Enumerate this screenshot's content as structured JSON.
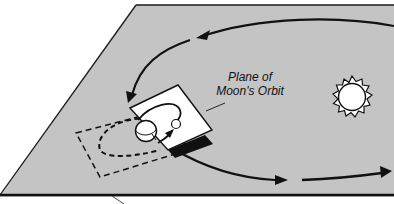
{
  "diagram": {
    "labels": {
      "plane_label_line1": "Plane of",
      "plane_label_line2": "Moon's Orbit"
    },
    "elements": {
      "ecliptic_plane": "gray parallelogram representing Earth's orbital plane",
      "sun": "sun-icon",
      "earth": "earth-icon",
      "moon": "moon-icon",
      "moon_orbit_plane": "tilted white plane",
      "moon_orbit_plane_projection": "dashed rectangle",
      "earth_orbit_arrows": "curved arrows showing Earth's orbit around Sun"
    },
    "colors": {
      "plane_fill": "#c4c4c4",
      "plane_edge": "#1a1a1a",
      "white_plane": "#ffffff",
      "ink": "#111111"
    }
  }
}
